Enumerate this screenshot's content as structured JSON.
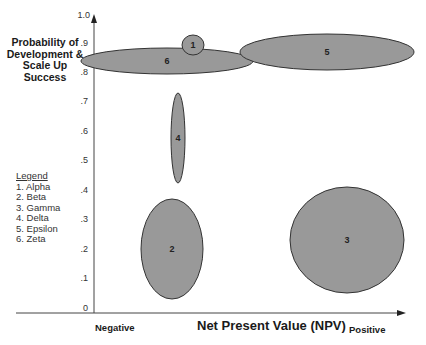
{
  "chart_data": {
    "type": "bubble-ellipse",
    "title": "",
    "xlabel": "Net Present Value (NPV)",
    "x_min_label": "Negative",
    "x_max_label": "Positive",
    "ylabel": "Probability of Development & Scale Up Success",
    "ylim": [
      0,
      1.0
    ],
    "yticks": [
      "0",
      ".1",
      ".2",
      ".3",
      ".4",
      ".5",
      ".6",
      ".7",
      ".8",
      ".9",
      "1.0"
    ],
    "grid": false,
    "legend": {
      "title": "Legend",
      "position": "left",
      "entries": [
        "1.  Alpha",
        "2.  Beta",
        "3.  Gamma",
        "4.  Delta",
        "5.  Epsilon",
        "6.  Zeta"
      ]
    },
    "series": [
      {
        "id": "1",
        "name": "Alpha",
        "x_center": 0.29,
        "y_center": 0.89,
        "x_range": [
          0.27,
          0.32
        ],
        "y_range": [
          0.86,
          0.91
        ]
      },
      {
        "id": "2",
        "name": "Beta",
        "x_center": 0.25,
        "y_center": 0.21,
        "x_range": [
          0.15,
          0.35
        ],
        "y_range": [
          0.04,
          0.37
        ]
      },
      {
        "id": "3",
        "name": "Gamma",
        "x_center": 0.8,
        "y_center": 0.23,
        "x_range": [
          0.65,
          0.94
        ],
        "y_range": [
          0.06,
          0.39
        ]
      },
      {
        "id": "4",
        "name": "Delta",
        "x_center": 0.27,
        "y_center": 0.58,
        "x_range": [
          0.25,
          0.29
        ],
        "y_range": [
          0.43,
          0.73
        ]
      },
      {
        "id": "5",
        "name": "Epsilon",
        "x_center": 0.74,
        "y_center": 0.87,
        "x_range": [
          0.48,
          0.98
        ],
        "y_range": [
          0.83,
          0.91
        ]
      },
      {
        "id": "6",
        "name": "Zeta",
        "x_center": 0.18,
        "y_center": 0.84,
        "x_range": [
          0.0,
          0.37
        ],
        "y_range": [
          0.8,
          0.88
        ]
      }
    ],
    "fill_color": "#999999",
    "stroke_color": "#333333"
  },
  "ellipses": [
    {
      "id": "6",
      "label": "6",
      "cx": 167,
      "cy": 61,
      "rx": 86,
      "ry": 13
    },
    {
      "id": "1",
      "label": "1",
      "cx": 193,
      "cy": 45,
      "rx": 11,
      "ry": 10
    },
    {
      "id": "5",
      "label": "5",
      "cx": 327,
      "cy": 52,
      "rx": 87,
      "ry": 18
    },
    {
      "id": "4",
      "label": "4",
      "cx": 178,
      "cy": 138,
      "rx": 7,
      "ry": 45
    },
    {
      "id": "2",
      "label": "2",
      "cx": 172,
      "cy": 249,
      "rx": 31,
      "ry": 50
    },
    {
      "id": "3",
      "label": "3",
      "cx": 347,
      "cy": 240,
      "rx": 57,
      "ry": 53
    }
  ]
}
